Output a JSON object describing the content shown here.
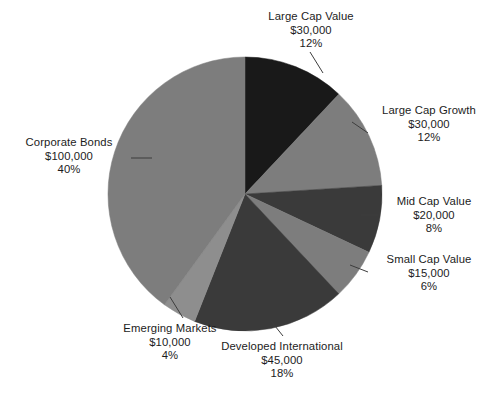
{
  "chart_data": {
    "type": "pie",
    "title": "",
    "total_value": 250000,
    "currency_symbol": "$",
    "legend_position": "none",
    "labels_position": "outside-with-leader-lines",
    "start_angle_deg": 0,
    "direction": "clockwise",
    "categories": [
      "Large Cap Value",
      "Large Cap Growth",
      "Mid Cap Value",
      "Small Cap Value",
      "Developed International",
      "Emerging Markets",
      "Corporate Bonds"
    ],
    "values": [
      30000,
      30000,
      20000,
      15000,
      45000,
      10000,
      100000
    ],
    "percentages": [
      12,
      12,
      8,
      6,
      18,
      4,
      40
    ],
    "colors": [
      "#191919",
      "#7d7d7d",
      "#3a3a3a",
      "#7d7d7d",
      "#3a3a3a",
      "#8e8e8e",
      "#7d7d7d"
    ],
    "slices": [
      {
        "name": "Large Cap Value",
        "value": 30000,
        "percent": 12,
        "value_text": "$30,000",
        "percent_text": "12%",
        "color": "#191919"
      },
      {
        "name": "Large Cap Growth",
        "value": 30000,
        "percent": 12,
        "value_text": "$30,000",
        "percent_text": "12%",
        "color": "#7d7d7d"
      },
      {
        "name": "Mid Cap Value",
        "value": 20000,
        "percent": 8,
        "value_text": "$20,000",
        "percent_text": "8%",
        "color": "#3a3a3a"
      },
      {
        "name": "Small Cap Value",
        "value": 15000,
        "percent": 6,
        "value_text": "$15,000",
        "percent_text": "6%",
        "color": "#7d7d7d"
      },
      {
        "name": "Developed International",
        "value": 45000,
        "percent": 18,
        "value_text": "$45,000",
        "percent_text": "18%",
        "color": "#3a3a3a"
      },
      {
        "name": "Emerging Markets",
        "value": 10000,
        "percent": 4,
        "value_text": "$10,000",
        "percent_text": "4%",
        "color": "#8e8e8e"
      },
      {
        "name": "Corporate Bonds",
        "value": 100000,
        "percent": 40,
        "value_text": "$100,000",
        "percent_text": "40%",
        "color": "#7d7d7d"
      }
    ]
  },
  "geometry": {
    "center_x": 245,
    "center_y": 194,
    "radius": 137,
    "leader_line_color": "#3d3d3d"
  }
}
